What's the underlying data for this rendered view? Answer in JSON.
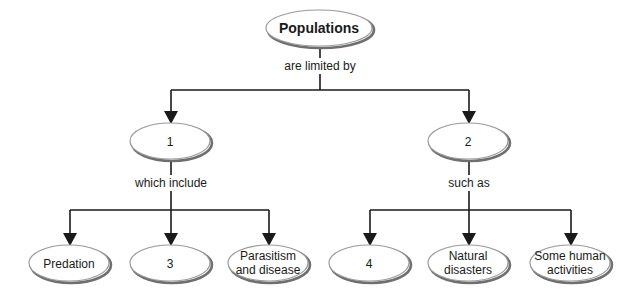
{
  "diagram": {
    "type": "concept-map",
    "root": {
      "label": "Populations",
      "bold": true
    },
    "root_link": "are limited by",
    "branches": [
      {
        "label": "1",
        "link": "which include",
        "children": [
          {
            "label": "Predation",
            "lines": [
              "Predation"
            ]
          },
          {
            "label": "3",
            "lines": [
              "3"
            ]
          },
          {
            "label": "Parasitism and disease",
            "lines": [
              "Parasitism",
              "and disease"
            ]
          }
        ]
      },
      {
        "label": "2",
        "link": "such as",
        "children": [
          {
            "label": "4",
            "lines": [
              "4"
            ]
          },
          {
            "label": "Natural disasters",
            "lines": [
              "Natural",
              "disasters"
            ]
          },
          {
            "label": "Some human activities",
            "lines": [
              "Some human",
              "activities"
            ]
          }
        ]
      }
    ],
    "colors": {
      "line": "#1a1a1a",
      "ellipse_stroke": "#9a9a9a",
      "ellipse_shadow": "#6f6f6f",
      "background": "#ffffff"
    }
  }
}
